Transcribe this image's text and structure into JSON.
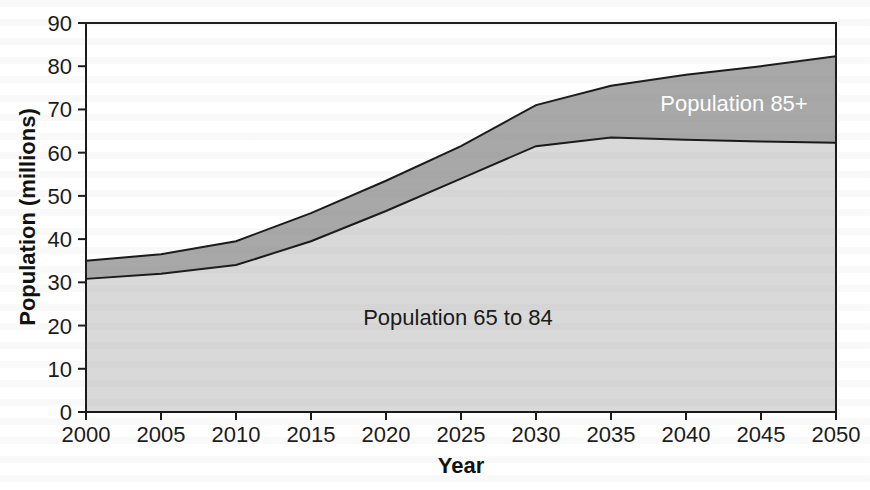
{
  "figure": {
    "background_color": "#ffffff"
  },
  "chart_data": {
    "type": "area",
    "stacked": true,
    "title": "",
    "xlabel": "Year",
    "ylabel": "Population (millions)",
    "x": [
      2000,
      2005,
      2010,
      2015,
      2020,
      2025,
      2030,
      2035,
      2040,
      2045,
      2050
    ],
    "series": [
      {
        "name": "Population 65 to 84",
        "values": [
          30.8,
          32.0,
          34.0,
          39.5,
          46.5,
          54.0,
          61.5,
          63.5,
          63.0,
          62.6,
          62.3
        ],
        "fill_color": "#d9d9d9",
        "label_color": "#1a1a1a"
      },
      {
        "name": "Population 85+",
        "values": [
          4.2,
          4.5,
          5.5,
          6.5,
          7.0,
          7.5,
          9.5,
          12.0,
          15.0,
          17.4,
          20.0
        ],
        "fill_color": "#a8a8a8",
        "label_color": "#ffffff"
      }
    ],
    "stacked_totals": [
      35.0,
      36.5,
      39.5,
      46.0,
      53.5,
      61.5,
      71.0,
      75.5,
      78.0,
      80.0,
      82.3
    ],
    "xlim": [
      2000,
      2050
    ],
    "ylim": [
      0,
      90
    ],
    "x_ticks": [
      2000,
      2005,
      2010,
      2015,
      2020,
      2025,
      2030,
      2035,
      2040,
      2045,
      2050
    ],
    "y_ticks": [
      0,
      10,
      20,
      30,
      40,
      50,
      60,
      70,
      80,
      90
    ],
    "grid": false,
    "legend_position": "in-chart labels",
    "line_color": "#1a1a1a",
    "tick_label_color": "#1a1a1a",
    "annotations": [
      {
        "text": "Population 65 to 84",
        "x": 2024.8,
        "y": 21.7,
        "color": "#1a1a1a"
      },
      {
        "text": "Population 85+",
        "x": 2043.2,
        "y": 71.3,
        "color": "#ffffff"
      }
    ]
  }
}
